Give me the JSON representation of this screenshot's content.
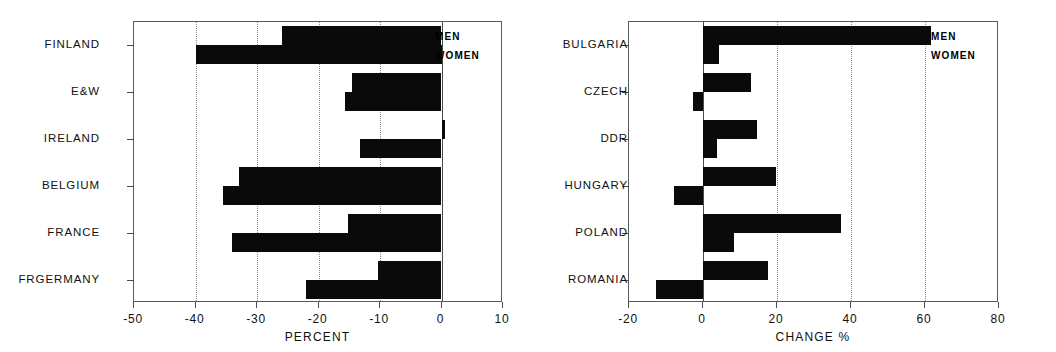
{
  "chart_data": [
    {
      "id": "left",
      "type": "bar",
      "orientation": "horizontal",
      "title": "",
      "xlabel": "PERCENT",
      "ylabel": "",
      "xlim": [
        -50,
        10
      ],
      "xticks": [
        -50,
        -40,
        -30,
        -20,
        -10,
        0,
        10
      ],
      "xticklabels": [
        "-50",
        "-40",
        "-30",
        "-20",
        "-10",
        "0",
        "10"
      ],
      "gridlines_at": [
        -40,
        -30,
        -20,
        -10
      ],
      "grid": "vertical-dotted",
      "categories": [
        "FINLAND",
        "E&W",
        "IRELAND",
        "BELGIUM",
        "FRANCE",
        "FRGERMANY"
      ],
      "legend": [
        "MEN",
        "WOMEN"
      ],
      "legend_position": "top-right-inside",
      "series": [
        {
          "name": "MEN",
          "values": [
            -26.0,
            -14.6,
            0.6,
            -33.0,
            -15.2,
            -10.3
          ]
        },
        {
          "name": "WOMEN",
          "values": [
            -40.0,
            -15.7,
            -13.3,
            -35.5,
            -34.0,
            -22.1
          ]
        }
      ]
    },
    {
      "id": "right",
      "type": "bar",
      "orientation": "horizontal",
      "title": "",
      "xlabel": "CHANGE %",
      "ylabel": "",
      "xlim": [
        -20,
        80
      ],
      "xticks": [
        -20,
        0,
        20,
        40,
        60,
        80
      ],
      "xticklabels": [
        "-20",
        "0",
        "20",
        "40",
        "60",
        "80"
      ],
      "gridlines_at": [
        20,
        40,
        60
      ],
      "grid": "vertical-dotted",
      "categories": [
        "BULGARIA",
        "CZECH",
        "DDR",
        "HUNGARY",
        "POLAND",
        "ROMANIA"
      ],
      "legend": [
        "MEN",
        "WOMEN"
      ],
      "legend_position": "top-right-inside",
      "series": [
        {
          "name": "MEN",
          "values": [
            61.5,
            13.0,
            14.7,
            19.7,
            37.4,
            17.6
          ]
        },
        {
          "name": "WOMEN",
          "values": [
            4.4,
            -2.6,
            3.9,
            -7.8,
            8.3,
            -12.7
          ]
        }
      ]
    }
  ],
  "style": {
    "bar_color": "#0a0a0a",
    "frame_color": "#5a5a5a",
    "grid_color": "#8a8a8a",
    "background": "#ffffff"
  }
}
